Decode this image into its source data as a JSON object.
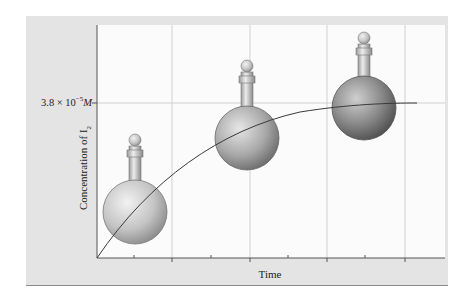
{
  "figure": {
    "y_axis_title": "Concentration of I",
    "y_axis_title_subscript": "2",
    "x_axis_title": "Time",
    "y_marker_label": {
      "mantissa": "3.8 × 10",
      "exponent": "−5",
      "unit": "M"
    },
    "flasks": [
      {
        "position": "early",
        "shade": "light"
      },
      {
        "position": "middle",
        "shade": "medium"
      },
      {
        "position": "late",
        "shade": "dark"
      }
    ]
  },
  "colors": {
    "panel": "#e4e4e4",
    "plot_bg": "#fbfbfb",
    "grid": "#c8c8c8",
    "axis": "#555555",
    "curve": "#3a3a3a"
  }
}
